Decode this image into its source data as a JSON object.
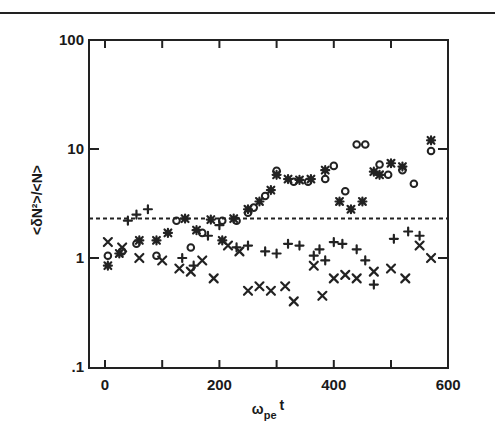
{
  "chart_data": {
    "type": "scatter",
    "title": "",
    "xlabel": "ω_pe t",
    "xlabel_main": "ω",
    "xlabel_sub": "pe",
    "xlabel_tail": "t",
    "ylabel": "<δN²>/<N>",
    "xlim": [
      -25,
      600
    ],
    "ylim": [
      0.1,
      100
    ],
    "yscale": "log",
    "grid": false,
    "legend": null,
    "x_ticks": [
      0,
      200,
      400,
      600
    ],
    "x_tick_labels": [
      "0",
      "200",
      "400",
      "600"
    ],
    "x_minor_ticks": [
      100,
      300,
      500
    ],
    "y_ticks": [
      0.1,
      1,
      10,
      100
    ],
    "y_tick_labels": [
      ".1",
      "1",
      "10",
      "100"
    ],
    "reference_line": {
      "style": "dashed",
      "y": 2.3
    },
    "series": [
      {
        "name": "circle",
        "marker": "o",
        "points": [
          [
            5,
            1.05
          ],
          [
            30,
            1.15
          ],
          [
            55,
            1.35
          ],
          [
            90,
            1.05
          ],
          [
            125,
            2.2
          ],
          [
            150,
            1.25
          ],
          [
            170,
            1.7
          ],
          [
            205,
            2.2
          ],
          [
            230,
            2.2
          ],
          [
            250,
            2.6
          ],
          [
            260,
            2.9
          ],
          [
            280,
            3.7
          ],
          [
            300,
            6.3
          ],
          [
            330,
            5.0
          ],
          [
            355,
            5.0
          ],
          [
            385,
            5.3
          ],
          [
            400,
            7.0
          ],
          [
            420,
            4.1
          ],
          [
            440,
            11
          ],
          [
            455,
            11
          ],
          [
            480,
            7.2
          ],
          [
            495,
            5.8
          ],
          [
            520,
            6.4
          ],
          [
            540,
            4.8
          ],
          [
            570,
            9.6
          ]
        ]
      },
      {
        "name": "asterisk",
        "marker": "*",
        "points": [
          [
            5,
            0.85
          ],
          [
            25,
            1.1
          ],
          [
            60,
            1.45
          ],
          [
            90,
            1.45
          ],
          [
            110,
            1.7
          ],
          [
            140,
            2.3
          ],
          [
            160,
            1.8
          ],
          [
            185,
            2.25
          ],
          [
            205,
            1.45
          ],
          [
            225,
            2.3
          ],
          [
            250,
            2.8
          ],
          [
            270,
            3.3
          ],
          [
            290,
            4.2
          ],
          [
            300,
            5.8
          ],
          [
            320,
            5.3
          ],
          [
            340,
            5.2
          ],
          [
            360,
            5.3
          ],
          [
            385,
            6.4
          ],
          [
            410,
            3.3
          ],
          [
            430,
            2.8
          ],
          [
            450,
            3.3
          ],
          [
            470,
            6.2
          ],
          [
            480,
            5.8
          ],
          [
            500,
            7.4
          ],
          [
            520,
            6.9
          ],
          [
            570,
            12
          ]
        ]
      },
      {
        "name": "plus",
        "marker": "+",
        "points": [
          [
            40,
            2.2
          ],
          [
            55,
            2.5
          ],
          [
            75,
            2.8
          ],
          [
            135,
            1.0
          ],
          [
            155,
            0.85
          ],
          [
            180,
            1.6
          ],
          [
            200,
            2.0
          ],
          [
            230,
            1.25
          ],
          [
            250,
            1.3
          ],
          [
            280,
            1.15
          ],
          [
            300,
            1.1
          ],
          [
            320,
            1.35
          ],
          [
            340,
            1.3
          ],
          [
            365,
            1.05
          ],
          [
            375,
            1.2
          ],
          [
            385,
            0.95
          ],
          [
            400,
            1.4
          ],
          [
            415,
            1.35
          ],
          [
            440,
            1.2
          ],
          [
            455,
            0.95
          ],
          [
            470,
            0.57
          ],
          [
            505,
            1.5
          ],
          [
            530,
            1.75
          ],
          [
            550,
            1.6
          ]
        ]
      },
      {
        "name": "cross",
        "marker": "x",
        "points": [
          [
            5,
            1.4
          ],
          [
            30,
            1.25
          ],
          [
            60,
            1.0
          ],
          [
            100,
            0.95
          ],
          [
            130,
            0.8
          ],
          [
            150,
            0.75
          ],
          [
            170,
            0.95
          ],
          [
            190,
            0.65
          ],
          [
            215,
            1.3
          ],
          [
            235,
            1.15
          ],
          [
            250,
            0.5
          ],
          [
            270,
            0.55
          ],
          [
            290,
            0.5
          ],
          [
            315,
            0.55
          ],
          [
            330,
            0.4
          ],
          [
            365,
            0.85
          ],
          [
            380,
            0.45
          ],
          [
            400,
            0.65
          ],
          [
            420,
            0.7
          ],
          [
            440,
            0.65
          ],
          [
            470,
            0.75
          ],
          [
            500,
            0.8
          ],
          [
            525,
            0.65
          ],
          [
            550,
            1.3
          ],
          [
            570,
            1.0
          ]
        ]
      }
    ]
  }
}
